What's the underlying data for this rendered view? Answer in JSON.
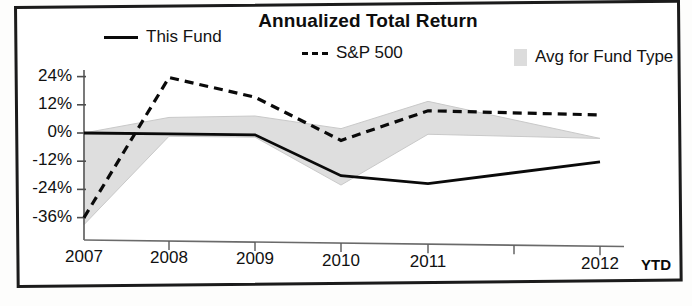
{
  "chart_data": {
    "type": "line",
    "title": "Annualized Total Return",
    "xlabel": "",
    "ylabel": "",
    "categories": [
      "2007",
      "2008",
      "2009",
      "2010",
      "2011",
      "2012"
    ],
    "x_axis_note": "YTD",
    "ytick_labels": [
      "24%",
      "12%",
      "0%",
      "-12%",
      "-24%",
      "-36%"
    ],
    "ytick_values": [
      24,
      12,
      0,
      -12,
      -24,
      -36
    ],
    "ylim": [
      -42,
      26
    ],
    "grid": false,
    "legend_position": "top",
    "series": [
      {
        "name": "This Fund",
        "style": "solid",
        "color": "#0a0a0a",
        "values": [
          0,
          0,
          0,
          -17,
          -20,
          -10
        ]
      },
      {
        "name": "S&P 500",
        "style": "dashed",
        "color": "#0a0a0a",
        "values": [
          -36,
          24,
          16,
          -2,
          11,
          10
        ]
      },
      {
        "name": "Avg for Fund Type",
        "style": "band",
        "color": "#dcdcdc",
        "upper": [
          0,
          7,
          8,
          3,
          15,
          0
        ],
        "lower": [
          -39,
          -1,
          -1,
          -21,
          1,
          0
        ]
      }
    ]
  },
  "chart": {
    "title": "Annualized Total Return"
  },
  "legend": {
    "items": [
      {
        "label": "This Fund",
        "icon": "solid-line-swatch"
      },
      {
        "label": "S&P 500",
        "icon": "dashed-line-swatch"
      },
      {
        "label": "Avg for Fund Type",
        "icon": "shaded-band-swatch"
      }
    ]
  },
  "axes": {
    "y_ticks": [
      "24%",
      "12%",
      "0%",
      "-12%",
      "-24%",
      "-36%"
    ],
    "x_ticks": [
      "2007",
      "2008",
      "2009",
      "2010",
      "2011",
      "2012"
    ],
    "x_suffix": "YTD"
  }
}
